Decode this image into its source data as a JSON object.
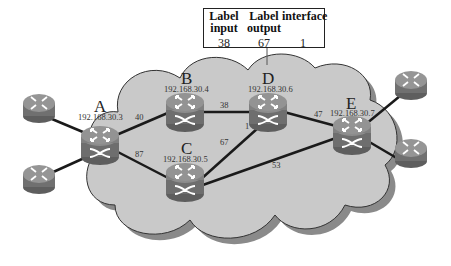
{
  "label_table": {
    "headers": [
      {
        "line1": "Label",
        "line2": "input"
      },
      {
        "line1": "Label",
        "line2": "output"
      },
      {
        "line1": "interface",
        "line2": ""
      }
    ],
    "values": [
      "38",
      "67",
      "1"
    ]
  },
  "nodes": [
    {
      "id": "A",
      "letter": "A",
      "ip": "192.168.30.3"
    },
    {
      "id": "B",
      "letter": "B",
      "ip": "192.168.30.4"
    },
    {
      "id": "C",
      "letter": "C",
      "ip": "192.168.30.5"
    },
    {
      "id": "D",
      "letter": "D",
      "ip": "192.168.30.6"
    },
    {
      "id": "E",
      "letter": "E",
      "ip": "192.168.30.7"
    }
  ],
  "links": [
    {
      "from": "A",
      "to": "B",
      "label": "40"
    },
    {
      "from": "A",
      "to": "C",
      "label": "87"
    },
    {
      "from": "B",
      "to": "D",
      "label": "38"
    },
    {
      "from": "C",
      "to": "D",
      "label": "67"
    },
    {
      "from": "C",
      "to": "E",
      "label": "53"
    },
    {
      "from": "D",
      "to": "E",
      "label": "47"
    },
    {
      "from": "D",
      "to": "D",
      "label": "1"
    }
  ],
  "colors": {
    "cloud": "#c9c9c9",
    "cloud_shadow": "#8a8a8a",
    "router_top": "#8c8c8c",
    "router_body": "#6e6e6e",
    "link": "#1a1a1a"
  }
}
